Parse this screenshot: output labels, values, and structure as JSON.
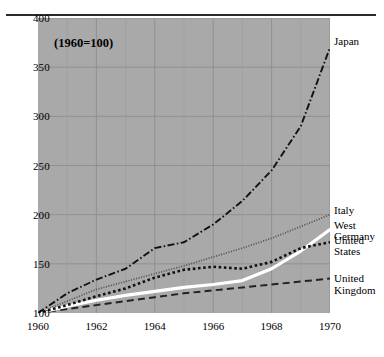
{
  "chart_data": {
    "type": "line",
    "title": "",
    "annotation": "(1960=100)",
    "xlabel": "",
    "ylabel": "",
    "xlim": [
      1960,
      1970
    ],
    "ylim": [
      100,
      400
    ],
    "yticks": [
      100,
      150,
      200,
      250,
      300,
      350,
      400
    ],
    "xticks": [
      1960,
      1962,
      1964,
      1966,
      1968,
      1970
    ],
    "xtick_labels": [
      "1960",
      "1962",
      "1964",
      "1966",
      "1968",
      "1970"
    ],
    "ytick_labels": [
      "100",
      "150",
      "200",
      "250",
      "300",
      "350",
      "400"
    ],
    "grid": true,
    "grid_minor_x": true,
    "legend_position": "right-of-axes-inline",
    "plot_background": "#a9a9a9",
    "x": [
      1960,
      1961,
      1962,
      1963,
      1964,
      1965,
      1966,
      1967,
      1968,
      1969,
      1970
    ],
    "series": [
      {
        "name": "Japan",
        "style": "dash-dot",
        "color": "#111111",
        "values": [
          100,
          120,
          134,
          145,
          166,
          172,
          190,
          214,
          245,
          290,
          370
        ]
      },
      {
        "name": "Italy",
        "style": "dotted-fine",
        "color": "#555555",
        "values": [
          100,
          112,
          124,
          132,
          140,
          148,
          157,
          166,
          176,
          188,
          200
        ]
      },
      {
        "name": "West Germany",
        "style": "solid-thick-white",
        "color": "#ffffff",
        "values": [
          100,
          107,
          113,
          118,
          122,
          126,
          129,
          133,
          145,
          163,
          185
        ]
      },
      {
        "name": "United States",
        "style": "square-dotted",
        "color": "#111111",
        "values": [
          100,
          108,
          117,
          125,
          136,
          144,
          147,
          145,
          152,
          166,
          172
        ]
      },
      {
        "name": "United Kingdom",
        "style": "dashed",
        "color": "#222222",
        "values": [
          100,
          104,
          108,
          112,
          116,
          120,
          123,
          126,
          129,
          132,
          135
        ]
      }
    ],
    "series_labels": [
      {
        "name": "Japan",
        "lines": [
          "Japan"
        ]
      },
      {
        "name": "Italy",
        "lines": [
          "Italy"
        ]
      },
      {
        "name": "West Germany",
        "lines": [
          "West",
          "Germany"
        ]
      },
      {
        "name": "United States",
        "lines": [
          "United",
          "States"
        ]
      },
      {
        "name": "United Kingdom",
        "lines": [
          "United",
          "Kingdom"
        ]
      }
    ]
  }
}
